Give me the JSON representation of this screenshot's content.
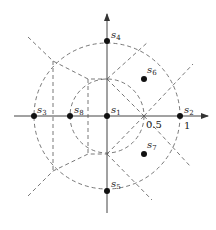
{
  "diagram": {
    "type": "signal constellation with decision regions",
    "origin": {
      "x": 107,
      "y": 116
    },
    "unit_px": 73,
    "axis_ticks": [
      {
        "label": "0.5",
        "value": 0.5
      },
      {
        "label": "1",
        "value": 1
      }
    ],
    "circles": [
      {
        "name": "inner-circle",
        "radius": 0.5,
        "style": "dashed"
      },
      {
        "name": "outer-circle",
        "radius": 1,
        "style": "dashed"
      }
    ],
    "points": [
      {
        "id": "s1",
        "base": "s",
        "sub": "1",
        "x": 0,
        "y": 0
      },
      {
        "id": "s2",
        "base": "s",
        "sub": "2",
        "x": 1,
        "y": 0
      },
      {
        "id": "s3",
        "base": "s",
        "sub": "3",
        "x": -1,
        "y": 0
      },
      {
        "id": "s4",
        "base": "s",
        "sub": "4",
        "x": 0,
        "y": 1
      },
      {
        "id": "s5",
        "base": "s",
        "sub": "5",
        "x": 0,
        "y": -1
      },
      {
        "id": "s6",
        "base": "s",
        "sub": "6",
        "x": 0.5,
        "y": 0.5
      },
      {
        "id": "s7",
        "base": "s",
        "sub": "7",
        "x": 0.5,
        "y": -0.5
      },
      {
        "id": "s8",
        "base": "s",
        "sub": "8",
        "x": -0.5,
        "y": 0
      }
    ]
  }
}
